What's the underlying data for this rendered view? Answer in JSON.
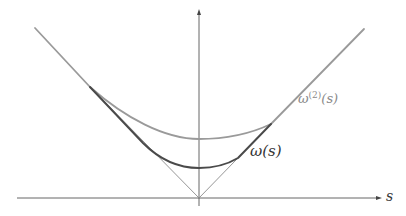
{
  "figure": {
    "axes": {
      "x_label": "s",
      "y_label": "",
      "origin": [
        199,
        198
      ],
      "x_axis": {
        "from": [
          17,
          198
        ],
        "to": [
          381,
          198
        ]
      },
      "y_axis": {
        "from": [
          199,
          205
        ],
        "to": [
          199,
          10
        ]
      },
      "color": "#555555"
    },
    "curves": [
      {
        "name": "abs-v",
        "description": "|s| asymptote lines (V shape)",
        "color": "#8a8a8a",
        "width": 0.9
      },
      {
        "name": "omega",
        "label_text": "ω",
        "label_arg": "(s)",
        "color": "#4a4a4a",
        "width": 2.0,
        "kink_left": [
          143,
          143
        ],
        "min_point": [
          199,
          168
        ],
        "kink_right": [
          238,
          158
        ]
      },
      {
        "name": "omega-2",
        "label_text": "ω",
        "label_sup": "(2)",
        "label_arg": "(s)",
        "color": "#9a9a9a",
        "width": 1.8,
        "kink_left": [
          90,
          87
        ],
        "min_point": [
          199,
          139
        ],
        "kink_right": [
          271,
          124
        ]
      }
    ],
    "v_endpoints": {
      "left": [
        35,
        28
      ],
      "right": [
        364,
        29
      ]
    }
  }
}
